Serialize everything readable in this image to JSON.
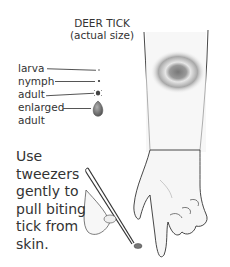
{
  "title": {
    "line1": "DEER TICK",
    "line2": "(actual size)"
  },
  "labels": [
    {
      "text": "larva"
    },
    {
      "text": "nymph"
    },
    {
      "text": "adult"
    },
    {
      "text": "enlarged"
    },
    {
      "text": "adult"
    }
  ],
  "instruction": {
    "lines": [
      "Use",
      "tweezers",
      "gently to",
      "pull biting",
      "tick from",
      "skin."
    ]
  }
}
